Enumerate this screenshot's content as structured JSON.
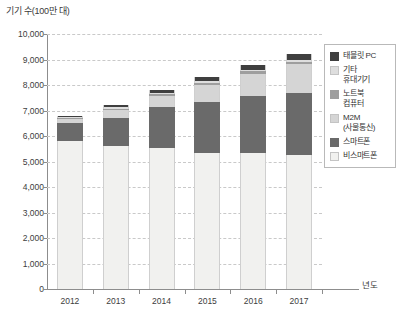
{
  "chart": {
    "type": "bar",
    "y_axis_title": "기기 수(100만 대)",
    "x_axis_title": "년도"
  },
  "chart_data": {
    "type": "bar",
    "title": "",
    "subtitle": "",
    "xlabel": "년도",
    "ylabel": "기기 수(100만 대)",
    "stacked": true,
    "grid": true,
    "legend_position": "right",
    "ylim": [
      0,
      10000
    ],
    "yticks": [
      0,
      1000,
      2000,
      3000,
      4000,
      5000,
      6000,
      7000,
      8000,
      9000,
      10000
    ],
    "ytick_labels": [
      "0",
      "1,000",
      "2,000",
      "3,000",
      "4,000",
      "5,000",
      "6,000",
      "7,000",
      "8,000",
      "9,000",
      "10,000"
    ],
    "categories": [
      "2012",
      "2013",
      "2014",
      "2015",
      "2016",
      "2017"
    ],
    "series": [
      {
        "name": "비스마트폰",
        "color": "#f1f1ef",
        "values": [
          5800,
          5620,
          5520,
          5350,
          5320,
          5270
        ]
      },
      {
        "name": "스마트폰",
        "color": "#6a6a6a",
        "values": [
          700,
          1100,
          1630,
          2000,
          2260,
          2420
        ]
      },
      {
        "name": "M2M (사물통신)",
        "color": "#d5d5d5",
        "values": [
          160,
          300,
          420,
          660,
          870,
          1120
        ]
      },
      {
        "name": "노트북 컴퓨터",
        "color": "#9e9e9e",
        "values": [
          45,
          55,
          70,
          80,
          90,
          95
        ]
      },
      {
        "name": "기타 휴대기기",
        "color": "#dedede",
        "values": [
          40,
          45,
          50,
          55,
          60,
          65
        ]
      },
      {
        "name": "태블릿 PC",
        "color": "#3f3f3f",
        "values": [
          55,
          80,
          110,
          155,
          200,
          260
        ]
      }
    ],
    "totals": [
      6800,
      7200,
      7800,
      8300,
      8800,
      9230
    ]
  },
  "legend": {
    "items": [
      {
        "label": "태블릿 PC",
        "label2": "",
        "color": "#3f3f3f"
      },
      {
        "label": "기타",
        "label2": "휴대기기",
        "color": "#dedede"
      },
      {
        "label": "노트북",
        "label2": "컴퓨터",
        "color": "#9e9e9e"
      },
      {
        "label": "M2M",
        "label2": "(사물통신)",
        "color": "#d5d5d5"
      },
      {
        "label": "스마트폰",
        "label2": "",
        "color": "#6a6a6a"
      },
      {
        "label": "비스마트폰",
        "label2": "",
        "color": "#f1f1ef"
      }
    ]
  }
}
